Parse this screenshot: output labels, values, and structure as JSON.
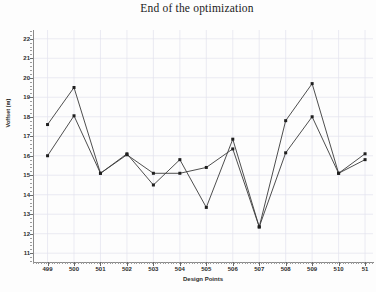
{
  "chart_data": {
    "type": "line",
    "title": "End of the optimization",
    "xlabel": "Design Points",
    "ylabel": "Voffset (m)",
    "grid": true,
    "legend": "none",
    "xlim": [
      498.45,
      511.3
    ],
    "ylim": [
      10.55,
      22.45
    ],
    "x": [
      499,
      500,
      501,
      502,
      503,
      504,
      505,
      506,
      507,
      508,
      509,
      510,
      511
    ],
    "xtick_labels": [
      "499",
      "500",
      "501",
      "502",
      "503",
      "504",
      "505",
      "506",
      "507",
      "508",
      "509",
      "510",
      "51"
    ],
    "ytick_labels": [
      "11",
      "12",
      "13",
      "14",
      "15",
      "16",
      "17",
      "18",
      "19",
      "20",
      "21",
      "22"
    ],
    "ytick_values": [
      11,
      12,
      13,
      14,
      15,
      16,
      17,
      18,
      19,
      20,
      21,
      22
    ],
    "series": [
      {
        "name": "series-1",
        "values": [
          17.6,
          19.5,
          15.1,
          16.1,
          14.5,
          15.8,
          13.35,
          16.85,
          12.35,
          17.8,
          19.7,
          15.1,
          16.1
        ]
      },
      {
        "name": "series-2",
        "values": [
          16.0,
          18.05,
          15.1,
          16.05,
          15.1,
          15.1,
          15.4,
          16.35,
          12.35,
          16.15,
          18.0,
          15.1,
          15.8
        ]
      }
    ]
  },
  "chart": {
    "title": "End of the optimization",
    "xlabel": "Design Points",
    "ylabel": "Voffset (m)"
  }
}
